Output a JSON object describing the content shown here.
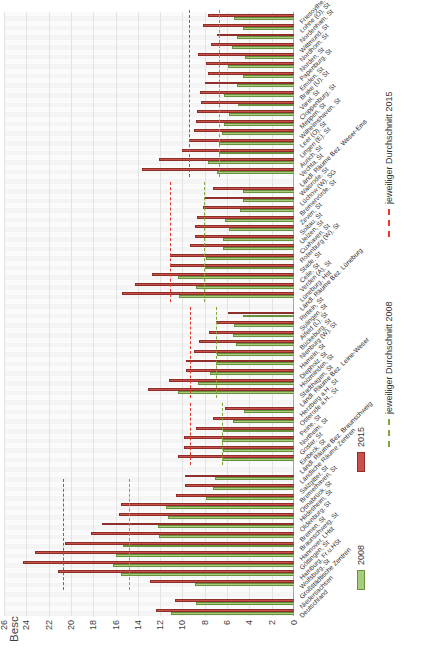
{
  "title": "Beschäftigte mit Hochschulabschluss, Anteil an den Beschäftigten insgesamt in v.H.",
  "legend": {
    "items": [
      {
        "label": "2008",
        "type": "box",
        "series": "2008"
      },
      {
        "label": "2015",
        "type": "box",
        "series": "2015"
      },
      {
        "label": "jeweiliger Durchschnitt 2008",
        "type": "dash",
        "series": "2008"
      },
      {
        "label": "jeweiliger Durchschnitt 2015",
        "type": "dash",
        "series": "2015"
      }
    ]
  },
  "colors": {
    "bar2008": "#a8cc7e",
    "bar2008_border": "#69923f",
    "bar2015": "#c9504a",
    "bar2015_border": "#8e2f2a",
    "avg2008": "#7fa73d",
    "avg2015": "#e2392c",
    "grid": "#e3e3e3",
    "axis": "#a6a6a6",
    "text": "#404040"
  },
  "chart_data": {
    "type": "bar",
    "title": "Beschäftigte mit Hochschulabschluss, Anteil an den Beschäftigten insgesamt in v.H.",
    "note": "original landscape bar chart displayed rotated 90° counterclockwise",
    "value_axis": {
      "min": 0,
      "max": 26,
      "step": 2,
      "unit": "v.H."
    },
    "legend_position": "bottom",
    "grid": true,
    "categories": [
      "Deutschland",
      "Niedersachsen",
      "Großstädtische Zentren",
      "Wolfsburg, St",
      "Hamburg, Fr.u.HSt",
      "Göttingen, St",
      "Hannover, LHst",
      "Braunschweig, St",
      "Bremen, St",
      "Oldenburg, St",
      "Hildesheim, St",
      "Osnabrück, St",
      "Bremerhaven, St",
      "Salzgitter, St",
      "Ländliche Räume Zentren",
      "Ländl. Räume Bez. Braunschweig",
      "Einbeck, St",
      "Goslar, St",
      "Northeim, St",
      "Peine, St",
      "Osterode a.H., St",
      "Herzberg a.H., St",
      "Ländl. Räume Bez. Leine-Weser",
      "Stadthagen, St",
      "Holzminden, St",
      "Diepholz, St",
      "Hameln, St",
      "Nienburg (W), St",
      "Bückeburg, St",
      "Alfeld (L), St",
      "Sulingen, St",
      "Rinteln, St",
      "Ländl. Räume Bez. Lüneburg",
      "Lüneburg, Hst",
      "Verden (A), St",
      "Celle, St",
      "Stade, St",
      "Rotenburg (W), St",
      "Cuxhaven, St",
      "Uelzen, St",
      "Soltau, St",
      "Zeven, St",
      "Bremervörde, St",
      "Lüchow (W), SG",
      "Walsrode, St",
      "Ländl. Räume Bez. Weser-Ems",
      "Vechta, St",
      "Aurich, St",
      "Lingen (E), St",
      "Leer (O), St",
      "Wilhelmshaven, St",
      "Meppen, St",
      "Cloppenburg, St",
      "Varel, St",
      "Brake (U), St",
      "Emden, St",
      "Papenburg, St",
      "Norden, St",
      "Nordhorn, St",
      "Wittmund, St",
      "Nordenham, St",
      "Lohne (O), St",
      "Friesoythe, St"
    ],
    "header_slots": [
      2,
      15,
      22,
      32,
      45
    ],
    "series": [
      {
        "name": "2008",
        "values": [
          11.0,
          8.8,
          null,
          8.9,
          15.5,
          16.2,
          16.0,
          15.3,
          12.1,
          12.2,
          11.3,
          11.5,
          7.9,
          7.3,
          7.1,
          null,
          6.5,
          6.4,
          6.5,
          6.4,
          5.5,
          4.5,
          null,
          10.4,
          8.6,
          7.5,
          7.0,
          6.9,
          5.2,
          5.5,
          5.4,
          4.6,
          null,
          10.3,
          8.8,
          10.4,
          8.0,
          7.9,
          6.4,
          6.4,
          5.8,
          6.2,
          4.8,
          4.6,
          4.6,
          null,
          6.9,
          7.7,
          6.7,
          6.7,
          6.5,
          6.3,
          5.8,
          5.0,
          6.3,
          5.1,
          4.6,
          5.9,
          4.4,
          5.6,
          5.1,
          4.6,
          5.4
        ]
      },
      {
        "name": "2015",
        "values": [
          12.4,
          10.7,
          null,
          12.9,
          21.2,
          24.3,
          23.2,
          20.5,
          18.2,
          17.2,
          15.7,
          15.5,
          10.6,
          9.8,
          9.8,
          null,
          10.4,
          9.9,
          9.9,
          8.8,
          7.3,
          6.2,
          null,
          13.1,
          11.2,
          9.7,
          9.7,
          9.0,
          8.5,
          7.6,
          7.0,
          5.9,
          null,
          15.4,
          14.3,
          12.7,
          11.1,
          11.1,
          9.3,
          8.9,
          8.9,
          8.7,
          8.2,
          8.0,
          7.3,
          null,
          13.6,
          12.1,
          10.0,
          9.4,
          9.0,
          8.8,
          8.7,
          8.3,
          8.4,
          8.0,
          7.7,
          7.9,
          8.6,
          7.4,
          6.9,
          8.2,
          7.7
        ]
      }
    ],
    "group_averages": [
      {
        "group": "Großstädtische Zentren",
        "start": 3,
        "end": 13,
        "avg_2008": 14.8,
        "avg_2015": 20.7
      },
      {
        "group": "Ländl. Räume Bez. Braunschweig",
        "start": 16,
        "end": 21,
        "avg_2008": 6.5,
        "avg_2015": 9.35
      },
      {
        "group": "Ländl. Räume Bez. Leine-Weser",
        "start": 23,
        "end": 31,
        "avg_2008": 7.0,
        "avg_2015": 9.3
      },
      {
        "group": "Ländl. Räume Bez. Lüneburg",
        "start": 33,
        "end": 44,
        "avg_2008": 8.1,
        "avg_2015": 11.1
      },
      {
        "group": "Ländl. Räume Bez. Weser-Ems",
        "start": 46,
        "end": 62,
        "avg_2008": 6.7,
        "avg_2015": 9.4
      }
    ]
  }
}
